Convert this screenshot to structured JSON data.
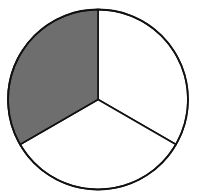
{
  "chart_data": {
    "type": "pie",
    "title": "",
    "slices": [
      {
        "label": "",
        "fraction": 0.3333,
        "color": "#6e6e6e",
        "shaded": true,
        "position": "upper-left"
      },
      {
        "label": "",
        "fraction": 0.3333,
        "color": "#ffffff",
        "shaded": false,
        "position": "right"
      },
      {
        "label": "",
        "fraction": 0.3333,
        "color": "#ffffff",
        "shaded": false,
        "position": "bottom"
      }
    ],
    "values": [
      1,
      1,
      1
    ],
    "start_angle_deg": -90,
    "legend": "none",
    "outline_color": "#111111"
  },
  "geometry": {
    "cx": 98,
    "cy": 99.5,
    "r": 90
  }
}
